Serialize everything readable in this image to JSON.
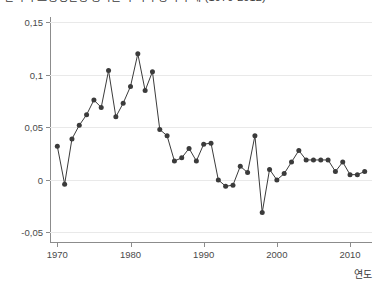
{
  "chart_data": {
    "type": "line",
    "title": "한국의 노동생산성 증가율 추이와 장기 추세 (1970-2012)",
    "xlabel": "연도",
    "ylabel": "",
    "xlim": [
      1969,
      2013
    ],
    "ylim": [
      -0.06,
      0.155
    ],
    "grid": true,
    "legend": null,
    "marker": "filled-circle",
    "series_color": "#3b3b3b",
    "grid_color": "#e9e9e9",
    "axis_color": "#8c8c8c",
    "y_ticks": [
      {
        "value": 0.15,
        "label": "0,15"
      },
      {
        "value": 0.1,
        "label": "0,1"
      },
      {
        "value": 0.05,
        "label": "0,05"
      },
      {
        "value": 0,
        "label": "0"
      },
      {
        "value": -0.05,
        "label": "-0,05"
      }
    ],
    "x_ticks": [
      {
        "value": 1970,
        "label": "1970"
      },
      {
        "value": 1980,
        "label": "1980"
      },
      {
        "value": 1990,
        "label": "1990"
      },
      {
        "value": 2000,
        "label": "2000"
      },
      {
        "value": 2010,
        "label": "2010"
      }
    ],
    "x": [
      1970,
      1971,
      1972,
      1973,
      1974,
      1975,
      1976,
      1977,
      1978,
      1979,
      1980,
      1981,
      1982,
      1983,
      1984,
      1985,
      1986,
      1987,
      1988,
      1989,
      1990,
      1991,
      1992,
      1993,
      1994,
      1995,
      1996,
      1997,
      1998,
      1999,
      2000,
      2001,
      2002,
      2003,
      2004,
      2005,
      2006,
      2007,
      2008,
      2009,
      2010,
      2011,
      2012
    ],
    "values": [
      0.032,
      -0.004,
      0.039,
      0.052,
      0.062,
      0.076,
      0.069,
      0.104,
      0.06,
      0.073,
      0.089,
      0.12,
      0.085,
      0.103,
      0.048,
      0.042,
      0.018,
      0.021,
      0.03,
      0.018,
      0.034,
      0.035,
      0.0,
      -0.006,
      -0.005,
      0.013,
      0.007,
      0.042,
      -0.031,
      0.01,
      0.0,
      0.006,
      0.017,
      0.028,
      0.019,
      0.019,
      0.019,
      0.019,
      0.008,
      0.017,
      0.005,
      0.005,
      0.008
    ],
    "values_label_format": "comma-decimal"
  }
}
